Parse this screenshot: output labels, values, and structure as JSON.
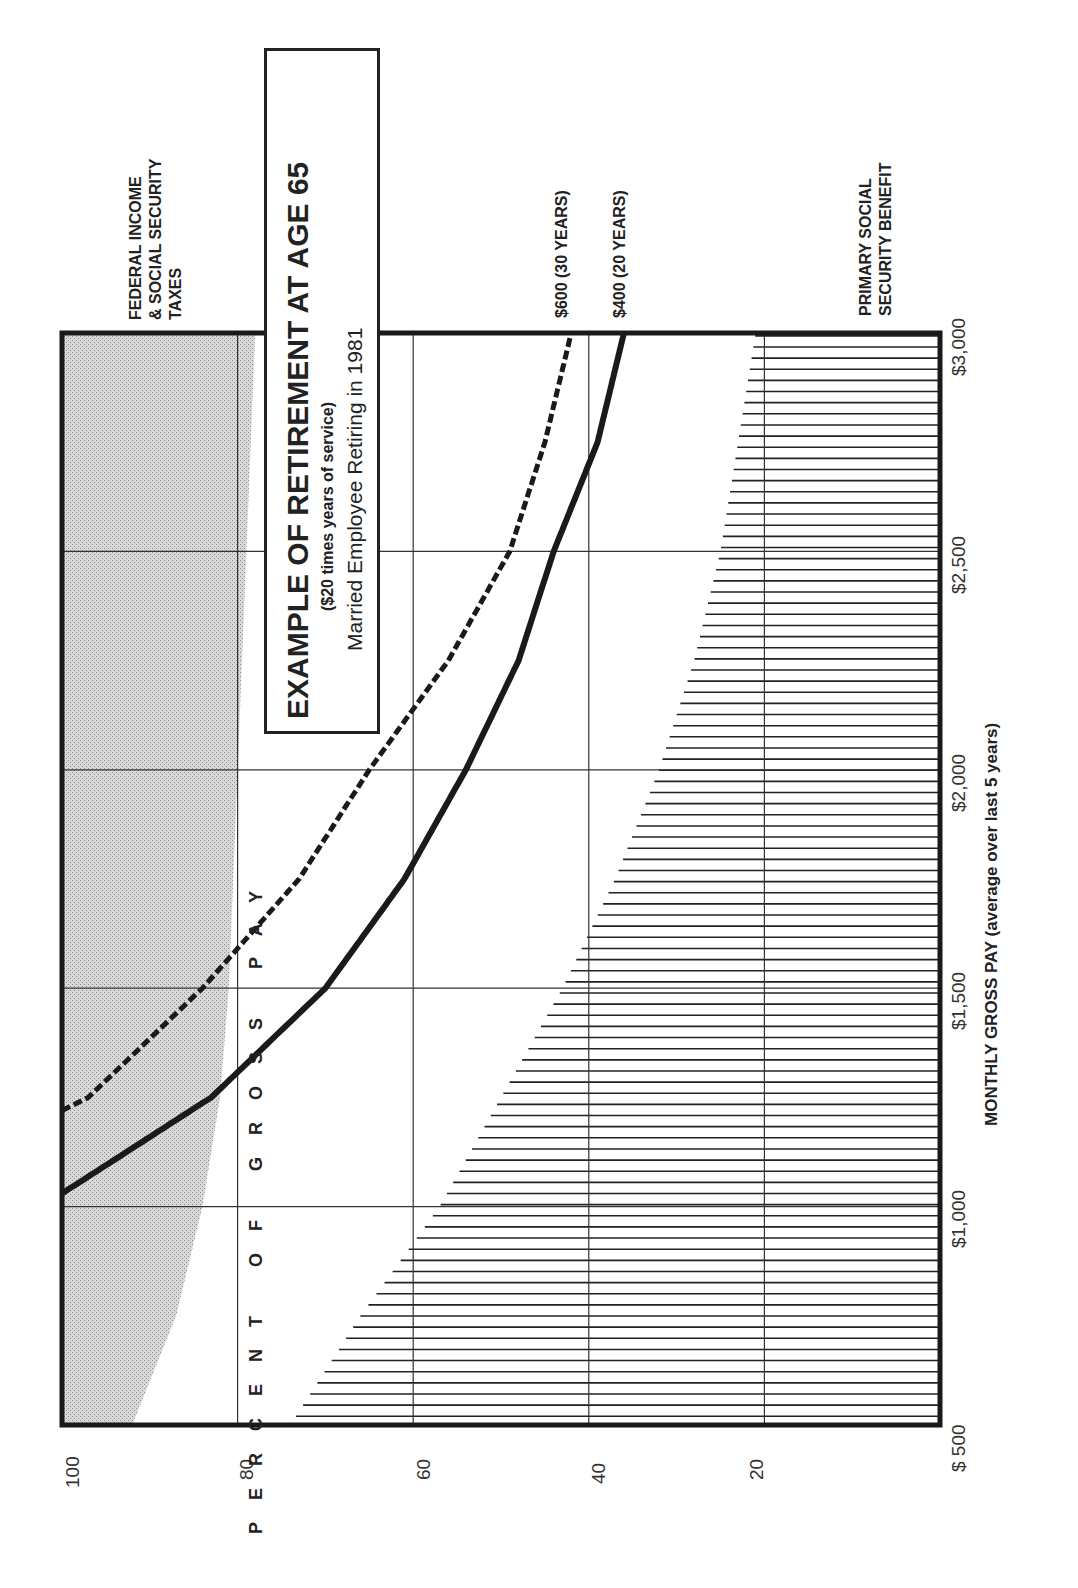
{
  "chart_data": {
    "type": "area",
    "orientation": "rotated-90-ccw",
    "title": "EXAMPLE OF RETIREMENT AT AGE 65",
    "subtitle": "($20 times years of service)",
    "subtitle2": "Married Employee Retiring in 1981",
    "xlabel": "MONTHLY GROSS PAY (average over last 5 years)",
    "ylabel": "PERCENT OF GROSS PAY",
    "xlim": [
      500,
      3000
    ],
    "ylim": [
      0,
      100
    ],
    "grid": true,
    "x_ticks": [
      "$ 500",
      "$1,000",
      "$1,500",
      "$2,000",
      "$2,500",
      "$3,000"
    ],
    "x_tick_values": [
      500,
      1000,
      1500,
      2000,
      2500,
      3000
    ],
    "y_ticks": [
      "100",
      "80",
      "60",
      "40",
      "20"
    ],
    "y_tick_values": [
      100,
      80,
      60,
      40,
      20
    ],
    "x": [
      500,
      750,
      1000,
      1250,
      1500,
      1750,
      2000,
      2250,
      2500,
      2750,
      3000
    ],
    "series": [
      {
        "name": "FEDERAL INCOME & SOCIAL SECURITY TAXES",
        "style": "stippled-gray-band",
        "note": "band from the lower edge up to 100%",
        "values": [
          92,
          87,
          84,
          82,
          81,
          80.5,
          80,
          79.5,
          79,
          78.5,
          78
        ]
      },
      {
        "name": "$600 (30 YEARS)",
        "style": "dashed",
        "x": [
          1220,
          1250,
          1500,
          1750,
          2000,
          2250,
          2500,
          2750,
          3000
        ],
        "values": [
          100,
          97,
          84,
          73,
          65,
          56,
          49,
          45,
          42
        ]
      },
      {
        "name": "$400 (20 YEARS)",
        "style": "solid",
        "x": [
          1030,
          1250,
          1500,
          1750,
          2000,
          2250,
          2500,
          2750,
          3000
        ],
        "values": [
          100,
          83,
          70,
          61,
          54,
          48,
          44,
          39,
          36
        ]
      },
      {
        "name": "PRIMARY SOCIAL SECURITY BENEFIT",
        "style": "vertical-hatch",
        "values": [
          74,
          66,
          57,
          50,
          43,
          37,
          32,
          28,
          25,
          23,
          21
        ]
      }
    ],
    "annotations": [
      "FEDERAL INCOME & SOCIAL SECURITY TAXES",
      "$600 (30 YEARS)",
      "$400 (20 YEARS)",
      "PRIMARY SOCIAL SECURITY BENEFIT"
    ],
    "colors": {
      "ink": "#1a1a1a",
      "shade": "#c8c8c8",
      "grid": "#333333"
    }
  },
  "labels": {
    "title": "EXAMPLE OF RETIREMENT AT AGE 65",
    "subtitle": "($20 times years of service)",
    "subtitle2": "Married Employee Retiring in 1981",
    "taxes_line1": "FEDERAL INCOME",
    "taxes_line2": "& SOCIAL SECURITY",
    "taxes_line3": "TAXES",
    "curve600": "$600 (30 YEARS)",
    "curve400": "$400 (20 YEARS)",
    "ss_line1": "PRIMARY SOCIAL",
    "ss_line2": "SECURITY BENEFIT",
    "xlabel": "MONTHLY GROSS PAY (average over last 5 years)",
    "ylabel": "PERCENT OF GROSS PAY",
    "x_ticks": [
      "$ 500",
      "$1,000",
      "$1,500",
      "$2,000",
      "$2,500",
      "$3,000"
    ],
    "y_ticks": [
      "100",
      "80",
      "60",
      "40",
      "20"
    ]
  }
}
